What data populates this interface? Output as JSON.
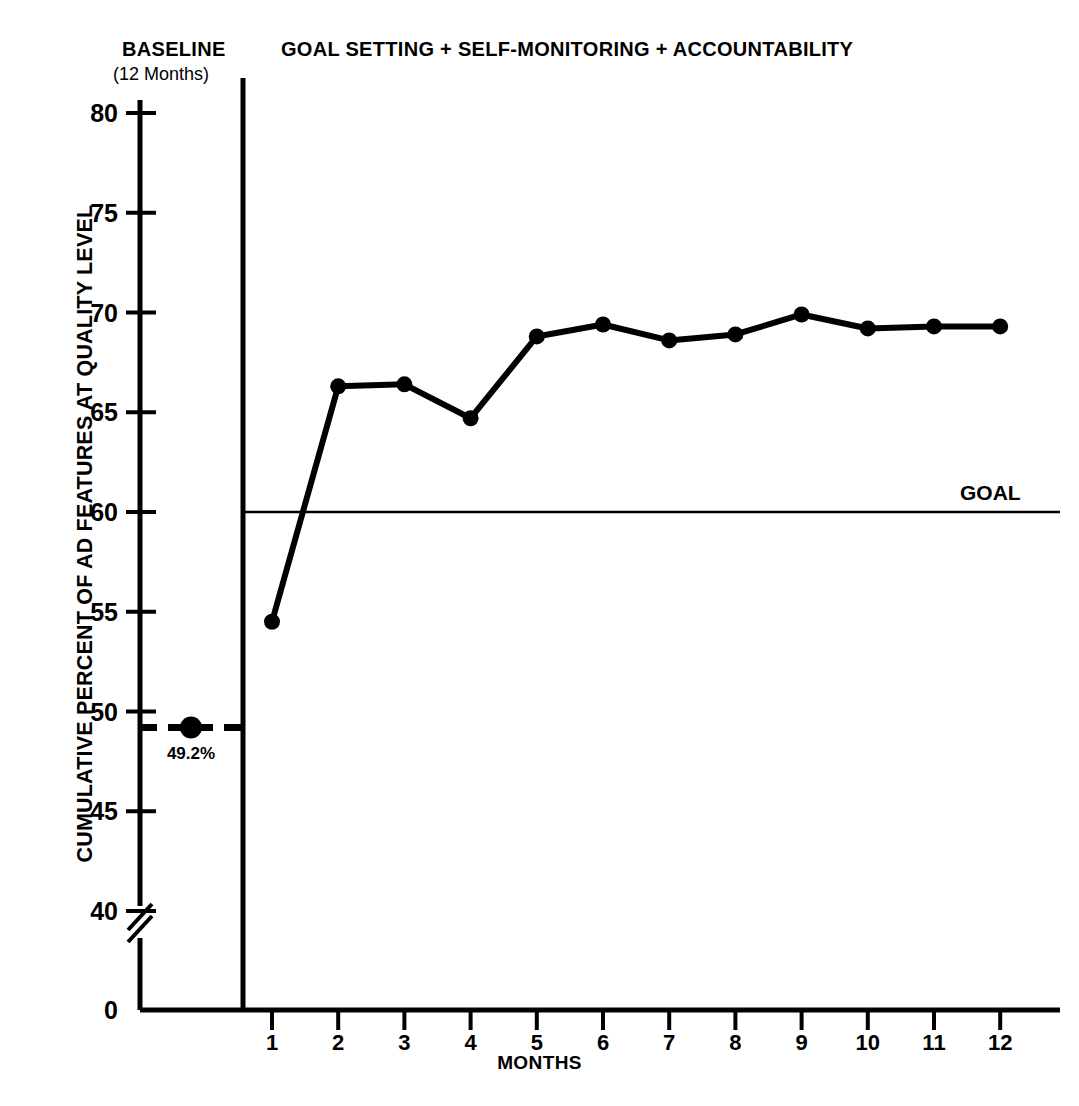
{
  "figure": {
    "phase_labels": {
      "baseline_title": "BASELINE",
      "baseline_subtitle": "(12 Months)",
      "treatment_title": "GOAL SETTING + SELF-MONITORING + ACCOUNTABILITY"
    },
    "goal_label": "GOAL",
    "baseline_point_label": "49.2%"
  },
  "chart_data": {
    "type": "line",
    "title": "GOAL SETTING + SELF-MONITORING + ACCOUNTABILITY",
    "xlabel": "MONTHS",
    "ylabel": "CUMULATIVE PERCENT OF AD FEATURES AT QUALITY LEVEL",
    "x": [
      1,
      2,
      3,
      4,
      5,
      6,
      7,
      8,
      9,
      10,
      11,
      12
    ],
    "values": [
      54.5,
      66.3,
      66.4,
      64.7,
      68.8,
      69.4,
      68.6,
      68.9,
      69.9,
      69.2,
      69.3,
      69.3
    ],
    "series": [
      {
        "name": "Cumulative percent of AD features at quality level",
        "values": [
          54.5,
          66.3,
          66.4,
          64.7,
          68.8,
          69.4,
          68.6,
          68.9,
          69.9,
          69.2,
          69.3,
          69.3
        ]
      }
    ],
    "baseline": {
      "label": "BASELINE",
      "duration_label": "(12 Months)",
      "value": 49.2,
      "value_label": "49.2%",
      "line_style": "dashed"
    },
    "goal_line": {
      "label": "GOAL",
      "value": 60,
      "line_style": "solid"
    },
    "xlim": [
      0.5,
      12.5
    ],
    "ylim": [
      40,
      80
    ],
    "yticks": [
      40,
      45,
      50,
      55,
      60,
      65,
      70,
      75,
      80
    ],
    "ytick_labels": [
      "40",
      "45",
      "50",
      "55",
      "60",
      "65",
      "70",
      "75",
      "80"
    ],
    "y_zero_tick_label": "0",
    "y_axis_break": true,
    "xticks": [
      1,
      2,
      3,
      4,
      5,
      6,
      7,
      8,
      9,
      10,
      11,
      12
    ],
    "xtick_labels": [
      "1",
      "2",
      "3",
      "4",
      "5",
      "6",
      "7",
      "8",
      "9",
      "10",
      "11",
      "12"
    ],
    "grid": false,
    "legend": "none",
    "marker": "filled-circle",
    "line_color": "#000000"
  }
}
